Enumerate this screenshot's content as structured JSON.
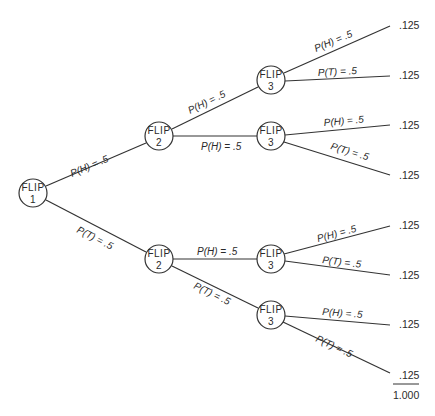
{
  "diagram": {
    "type": "probability-tree",
    "nodes": [
      {
        "id": "f1",
        "line1": "FLIP",
        "line2": "1",
        "cx": 33,
        "cy": 193
      },
      {
        "id": "f2a",
        "line1": "FLIP",
        "line2": "2",
        "cx": 159,
        "cy": 136
      },
      {
        "id": "f2b",
        "line1": "FLIP",
        "line2": "2",
        "cx": 159,
        "cy": 259
      },
      {
        "id": "f3a",
        "line1": "FLIP",
        "line2": "3",
        "cx": 271,
        "cy": 80
      },
      {
        "id": "f3b",
        "line1": "FLIP",
        "line2": "3",
        "cx": 271,
        "cy": 136
      },
      {
        "id": "f3c",
        "line1": "FLIP",
        "line2": "3",
        "cx": 271,
        "cy": 259
      },
      {
        "id": "f3d",
        "line1": "FLIP",
        "line2": "3",
        "cx": 271,
        "cy": 315
      }
    ],
    "edges": [
      {
        "from": "f1",
        "to": "f2a",
        "label": "P(H) = .5"
      },
      {
        "from": "f1",
        "to": "f2b",
        "label": "P(T) = .5"
      },
      {
        "from": "f2a",
        "to": "f3a",
        "label": "P(H) = .5"
      },
      {
        "from": "f2a",
        "to": "f3b",
        "label": "P(H) = .5"
      },
      {
        "from": "f2b",
        "to": "f3c",
        "label": "P(H) = .5"
      },
      {
        "from": "f2b",
        "to": "f3d",
        "label": "P(T) = .5"
      },
      {
        "from": "f3a",
        "to": "o1",
        "label": "P(H) = .5"
      },
      {
        "from": "f3a",
        "to": "o2",
        "label": "P(T) = .5"
      },
      {
        "from": "f3b",
        "to": "o3",
        "label": "P(H) = .5"
      },
      {
        "from": "f3b",
        "to": "o4",
        "label": "P(T) = .5"
      },
      {
        "from": "f3c",
        "to": "o5",
        "label": "P(H) = .5"
      },
      {
        "from": "f3c",
        "to": "o6",
        "label": "P(T) = .5"
      },
      {
        "from": "f3d",
        "to": "o7",
        "label": "P(H) = .5"
      },
      {
        "from": "f3d",
        "to": "o8",
        "label": "P(T) = .5"
      }
    ],
    "outcomes": [
      {
        "id": "o1",
        "value": ".125"
      },
      {
        "id": "o2",
        "value": ".125"
      },
      {
        "id": "o3",
        "value": ".125"
      },
      {
        "id": "o4",
        "value": ".125"
      },
      {
        "id": "o5",
        "value": ".125"
      },
      {
        "id": "o6",
        "value": ".125"
      },
      {
        "id": "o7",
        "value": ".125"
      },
      {
        "id": "o8",
        "value": ".125"
      }
    ],
    "total": "1.000"
  }
}
